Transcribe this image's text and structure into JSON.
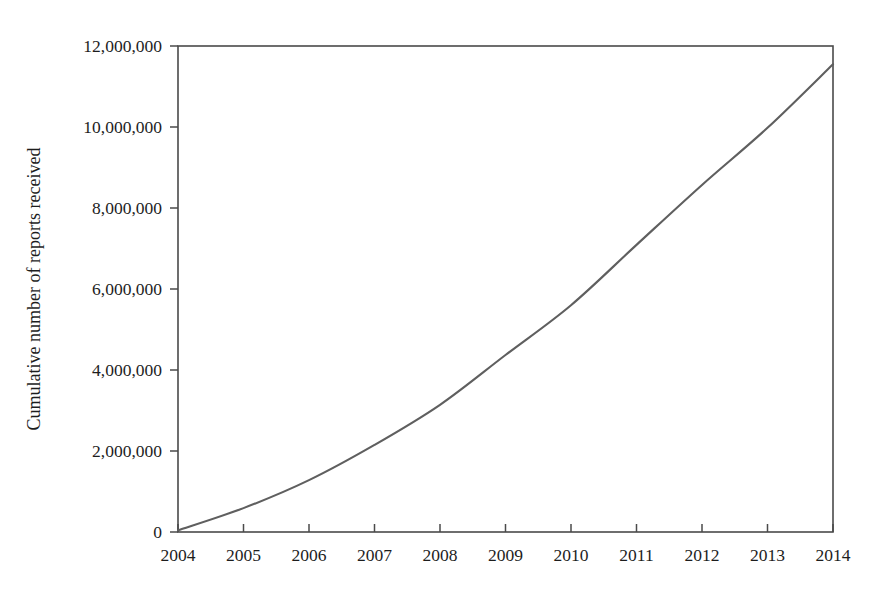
{
  "figure": {
    "background_color": "#ffffff",
    "frame_color": "#4a4a4a",
    "text_color": "#1d1d1d"
  },
  "chart_data": {
    "type": "line",
    "title": "",
    "subtitle": "",
    "xlabel": "",
    "ylabel": "Cumulative number of reports received",
    "x": [
      2004,
      2005,
      2006,
      2007,
      2008,
      2009,
      2010,
      2011,
      2012,
      2013,
      2014
    ],
    "categories": [
      "2004",
      "2005",
      "2006",
      "2007",
      "2008",
      "2009",
      "2010",
      "2011",
      "2012",
      "2013",
      "2014"
    ],
    "values": [
      40000,
      590000,
      1280000,
      2150000,
      3140000,
      4370000,
      5600000,
      7090000,
      8570000,
      9980000,
      11550000
    ],
    "series": [
      {
        "name": "Cumulative reports",
        "color": "#5f5f5f",
        "values": [
          40000,
          590000,
          1280000,
          2150000,
          3140000,
          4370000,
          5600000,
          7090000,
          8570000,
          9980000,
          11550000
        ]
      }
    ],
    "xlim": [
      2004,
      2014
    ],
    "ylim": [
      0,
      12000000
    ],
    "xticks": [
      2004,
      2005,
      2006,
      2007,
      2008,
      2009,
      2010,
      2011,
      2012,
      2013,
      2014
    ],
    "xtick_labels": [
      "2004",
      "2005",
      "2006",
      "2007",
      "2008",
      "2009",
      "2010",
      "2011",
      "2012",
      "2013",
      "2014"
    ],
    "yticks": [
      0,
      2000000,
      4000000,
      6000000,
      8000000,
      10000000,
      12000000
    ],
    "ytick_labels": [
      "0",
      "2,000,000",
      "4,000,000",
      "6,000,000",
      "8,000,000",
      "10,000,000",
      "12,000,000"
    ],
    "grid": false,
    "legend": false,
    "legend_position": "none",
    "annotations": []
  }
}
